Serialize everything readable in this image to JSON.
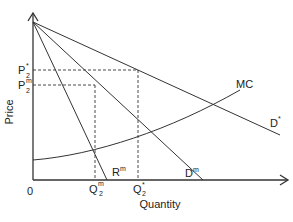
{
  "diagram": {
    "axes": {
      "y_label": "Price",
      "x_label": "Quantity",
      "origin_label": "0"
    },
    "price_labels": {
      "p_star": {
        "base": "P",
        "sup": "*",
        "sub": "2"
      },
      "p_m": {
        "base": "P",
        "sup": "m",
        "sub": "2"
      }
    },
    "quantity_labels": {
      "q_m": {
        "base": "Q",
        "sup": "m",
        "sub": "2"
      },
      "q_star": {
        "base": "Q",
        "sup": "*",
        "sub": "2"
      }
    },
    "curve_labels": {
      "mc": "MC",
      "d_star": {
        "base": "D",
        "sup": "*"
      },
      "d_m": {
        "base": "D",
        "sup": "m"
      },
      "r_m": {
        "base": "R",
        "sup": "m"
      }
    },
    "colors": {
      "line": "#333333",
      "text": "#222222",
      "background": "#ffffff"
    }
  }
}
